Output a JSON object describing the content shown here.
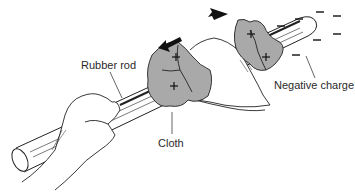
{
  "diagram": {
    "labels": {
      "rubber_rod": "Rubber rod",
      "cloth": "Cloth",
      "negative_charge": "Negative charge"
    },
    "symbols": {
      "plus": "+",
      "minus": "−"
    },
    "colors": {
      "cloth_fill": "#a9a9a9",
      "line": "#222222",
      "text": "#2a2a2a",
      "background": "#ffffff"
    }
  }
}
